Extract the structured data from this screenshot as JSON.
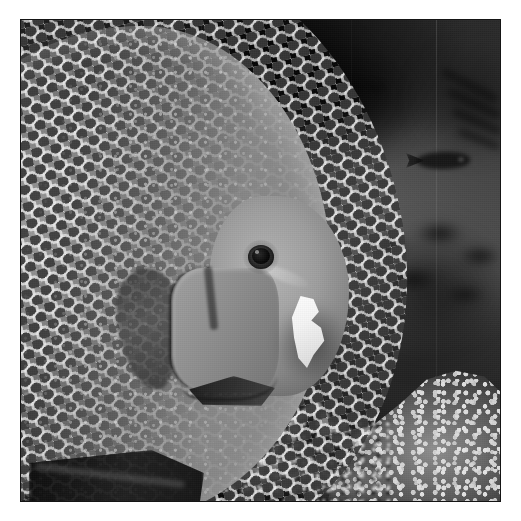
{
  "page": {
    "background_color": "#ffffff",
    "width": 521,
    "height": 521
  },
  "photo": {
    "alt": "Grayscale photograph of a large gray angelfish in profile inside an aquarium, feeding on a white morsel, with coral and a small background fish",
    "subject": "gray-angelfish",
    "color_mode": "grayscale",
    "frame": {
      "border_color": "#151515",
      "border_width_px": 1,
      "margin_left_px": 20,
      "margin_top_px": 19,
      "content_width_px": 481,
      "content_height_px": 483
    },
    "palette": {
      "deep_shadow": "#0b0b0b",
      "background_dark": "#1d1d1d",
      "background_mid": "#515151",
      "fish_body_mid": "#7d7d7d",
      "fish_highlight": "#b4b4b4",
      "scale_outline": "#f0f0f0",
      "scale_center": "#282828",
      "food_white": "#fdfdfd",
      "coral_bright": "#e8e8e8"
    },
    "elements": [
      {
        "name": "fish-body",
        "label": "Gray angelfish body",
        "note": "Large disc-shaped body cropped by the left edge of the frame"
      },
      {
        "name": "fish-scales",
        "label": "Reticulated scale pattern",
        "note": "Pale network outlining dark scale centers across the flank"
      },
      {
        "name": "fish-head",
        "label": "Head and snout"
      },
      {
        "name": "fish-eye",
        "label": "Eye with dark pupil"
      },
      {
        "name": "gill-plate",
        "label": "Gill cover (operculum)"
      },
      {
        "name": "pectoral-fin",
        "label": "Pectoral fin"
      },
      {
        "name": "pelvic-fin",
        "label": "Pelvic and anal fins"
      },
      {
        "name": "food-item",
        "label": "White morsel of food at the mouth"
      },
      {
        "name": "background-fish",
        "label": "Small silhouetted fish in the background"
      },
      {
        "name": "coral-right",
        "label": "Bright speckled coral head, lower right"
      },
      {
        "name": "coral-bottom",
        "label": "Branching coral and algae along the bottom"
      },
      {
        "name": "glass-seam",
        "label": "Vertical aquarium glass seam lines"
      }
    ]
  }
}
